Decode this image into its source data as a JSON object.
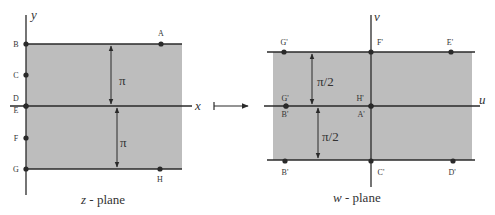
{
  "colors": {
    "shade": "#bdbdbd",
    "line": "#2a2a2a",
    "text": "#333333",
    "background": "#ffffff"
  },
  "z_plane": {
    "caption_var": "z",
    "caption_rest": "- plane",
    "axis_x_label": "x",
    "axis_y_label": "y",
    "strip_top_label": "π",
    "strip_bottom_label": "π",
    "points": [
      {
        "name": "A",
        "x": 161,
        "y": 44,
        "lx": 161,
        "ly": 36
      },
      {
        "name": "B",
        "x": 26,
        "y": 44,
        "lx": 16,
        "ly": 47
      },
      {
        "name": "C",
        "x": 26,
        "y": 75,
        "lx": 16,
        "ly": 78
      },
      {
        "name": "D",
        "x": 26,
        "y": 106,
        "lx": 16,
        "ly": 101
      },
      {
        "name": "E",
        "x": 26,
        "y": 106,
        "lx": 16,
        "ly": 113
      },
      {
        "name": "F",
        "x": 26,
        "y": 138,
        "lx": 16,
        "ly": 141
      },
      {
        "name": "G",
        "x": 26,
        "y": 169,
        "lx": 16,
        "ly": 172
      },
      {
        "name": "H",
        "x": 160,
        "y": 169,
        "lx": 160,
        "ly": 182
      }
    ]
  },
  "mapping_arrow": {
    "label": "maps-to"
  },
  "w_plane": {
    "caption_var": "w",
    "caption_rest": "- plane",
    "axis_u_label": "u",
    "axis_v_label": "v",
    "strip_top_label": "π/2",
    "strip_bottom_label": "π/2",
    "points": [
      {
        "name": "G'",
        "x": 284,
        "y": 52,
        "lx": 284,
        "ly": 45
      },
      {
        "name": "F'",
        "x": 371,
        "y": 52,
        "lx": 380,
        "ly": 45
      },
      {
        "name": "E'",
        "x": 451,
        "y": 52,
        "lx": 450,
        "ly": 45
      },
      {
        "name": "G'",
        "x": 286,
        "y": 106,
        "lx": 285,
        "ly": 101
      },
      {
        "name": "B'",
        "x": 286,
        "y": 106,
        "lx": 285,
        "ly": 117
      },
      {
        "name": "H'",
        "x": 371,
        "y": 106,
        "lx": 360,
        "ly": 101
      },
      {
        "name": "A'",
        "x": 371,
        "y": 106,
        "lx": 361,
        "ly": 117
      },
      {
        "name": "B'",
        "x": 285,
        "y": 161,
        "lx": 285,
        "ly": 175
      },
      {
        "name": "C'",
        "x": 371,
        "y": 161,
        "lx": 381,
        "ly": 175
      },
      {
        "name": "D'",
        "x": 453,
        "y": 161,
        "lx": 452,
        "ly": 175
      }
    ]
  }
}
